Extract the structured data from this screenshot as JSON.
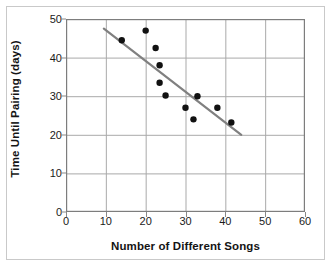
{
  "chart_data": {
    "type": "scatter",
    "title": "",
    "xlabel": "Number of Different Songs",
    "ylabel": "Time Until Pairing (days)",
    "xlim": [
      0,
      60
    ],
    "ylim": [
      0,
      50
    ],
    "xticks": [
      0,
      10,
      20,
      30,
      40,
      50,
      60
    ],
    "yticks": [
      0,
      10,
      20,
      30,
      40,
      50
    ],
    "xtick_labels": [
      "0",
      "10",
      "20",
      "30",
      "40",
      "50",
      "60"
    ],
    "ytick_labels": [
      "0",
      "10",
      "20",
      "30",
      "40",
      "50"
    ],
    "grid": true,
    "legend": false,
    "points": [
      {
        "x": 14.0,
        "y": 44.5
      },
      {
        "x": 20.0,
        "y": 47.0
      },
      {
        "x": 22.5,
        "y": 42.5
      },
      {
        "x": 23.5,
        "y": 38.0
      },
      {
        "x": 23.5,
        "y": 33.5
      },
      {
        "x": 25.0,
        "y": 30.2
      },
      {
        "x": 30.0,
        "y": 27.0
      },
      {
        "x": 32.0,
        "y": 24.0
      },
      {
        "x": 33.0,
        "y": 30.0
      },
      {
        "x": 38.0,
        "y": 27.0
      },
      {
        "x": 41.5,
        "y": 23.2
      }
    ],
    "trend_line": {
      "x1": 9.5,
      "y1": 47.5,
      "x2": 44.0,
      "y2": 20.0,
      "color": "#808080"
    },
    "point_color": "#111111",
    "point_radius": 3.2,
    "grid_color": "#a9a9a9",
    "axis_color": "#7d7d7d",
    "background": "#ffffff"
  }
}
